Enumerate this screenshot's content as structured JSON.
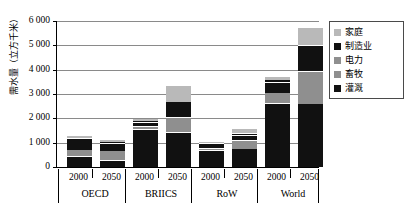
{
  "chart_data": {
    "type": "bar",
    "title": "",
    "subtitle": "",
    "xlabel": "",
    "ylabel": "需水量（立方千米）",
    "ylim": [
      0,
      6000
    ],
    "ytick_labels": [
      "6 000",
      "5 000",
      "4 000",
      "3 000",
      "2 000",
      "1 000",
      "0"
    ],
    "ytick_values": [
      6000,
      5000,
      4000,
      3000,
      2000,
      1000,
      0
    ],
    "grid": true,
    "stacked": true,
    "legend_position": "top-right",
    "legend": [
      "家庭",
      "制造业",
      "电力",
      "畜牧",
      "灌溉"
    ],
    "groups": [
      "OECD",
      "BRIICS",
      "RoW",
      "World"
    ],
    "categories": [
      "2000",
      "2050",
      "2000",
      "2050",
      "2000",
      "2050",
      "2000",
      "2050"
    ],
    "series": [
      {
        "name": "灌溉",
        "color": "#111111",
        "values": [
          430,
          250,
          1520,
          1400,
          660,
          730,
          2590,
          2580
        ]
      },
      {
        "name": "畜牧",
        "color": "#8f8f8f",
        "values": [
          230,
          380,
          110,
          600,
          70,
          330,
          420,
          1300
        ]
      },
      {
        "name": "电力",
        "color": "#111111",
        "values": [
          390,
          280,
          140,
          440,
          120,
          180,
          410,
          740
        ]
      },
      {
        "name": "制造业",
        "color": "#111111",
        "values": [
          40,
          40,
          30,
          140,
          20,
          60,
          70,
          280
        ]
      },
      {
        "name": "家庭",
        "color": "#b9b9b9",
        "values": [
          80,
          60,
          90,
          660,
          60,
          160,
          110,
          700
        ]
      }
    ],
    "totals": [
      1170,
      1010,
      1890,
      3240,
      930,
      1460,
      3600,
      5600
    ]
  },
  "colors": {
    "irrigation": "#111111",
    "livestock": "#8f8f8f",
    "electricity": "#8f8f8f",
    "manufacturing": "#111111",
    "household": "#b9b9b9",
    "gridline": "#8a8a8a",
    "axis": "#000000",
    "legend_border": "#4a4a4a",
    "background": "#ffffff"
  }
}
